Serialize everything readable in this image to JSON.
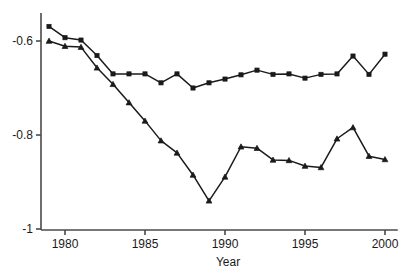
{
  "chart_data": {
    "type": "line",
    "title": "",
    "subtitle": "",
    "xlabel": "Year",
    "ylabel": "",
    "xlim": [
      1978.5,
      2000.8
    ],
    "ylim": [
      -1.005,
      -0.545
    ],
    "xticks": [
      1980,
      1985,
      1990,
      1995,
      2000
    ],
    "xtick_labels": [
      "1980",
      "1985",
      "1990",
      "1995",
      "2000"
    ],
    "yticks": [
      -0.6,
      -0.8,
      -1
    ],
    "ytick_labels": [
      "-0.6",
      "-0.8",
      "-1"
    ],
    "grid": false,
    "legend": "none",
    "x": [
      1979,
      1980,
      1981,
      1982,
      1983,
      1984,
      1985,
      1986,
      1987,
      1988,
      1989,
      1990,
      1991,
      1992,
      1993,
      1994,
      1995,
      1996,
      1997,
      1998,
      1999,
      2000
    ],
    "series": [
      {
        "name": "upper-series",
        "marker": "square",
        "color": "#1a1a1a",
        "values": [
          -0.569,
          -0.593,
          -0.598,
          -0.631,
          -0.67,
          -0.67,
          -0.67,
          -0.689,
          -0.67,
          -0.7,
          -0.689,
          -0.681,
          -0.672,
          -0.662,
          -0.671,
          -0.67,
          -0.679,
          -0.671,
          -0.67,
          -0.632,
          -0.671,
          -0.628
        ]
      },
      {
        "name": "lower-series",
        "marker": "triangle",
        "color": "#1a1a1a",
        "values": [
          -0.6,
          -0.611,
          -0.613,
          -0.657,
          -0.692,
          -0.731,
          -0.77,
          -0.812,
          -0.838,
          -0.885,
          -0.94,
          -0.889,
          -0.825,
          -0.828,
          -0.853,
          -0.854,
          -0.866,
          -0.869,
          -0.808,
          -0.784,
          -0.845,
          -0.852
        ]
      }
    ]
  }
}
